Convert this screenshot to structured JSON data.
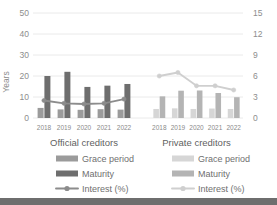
{
  "chart_data": {
    "type": "bar",
    "title": "",
    "categories": [
      "2018",
      "2019",
      "2020",
      "2021",
      "2022"
    ],
    "ylabel": "Years",
    "ylabel_right": "",
    "ylim": [
      0,
      50
    ],
    "ylim_right": [
      0,
      15
    ],
    "yticks": [
      "0",
      "10",
      "20",
      "30",
      "40",
      "50"
    ],
    "yticks_right": [
      "0",
      "3",
      "6",
      "9",
      "12",
      "15"
    ],
    "grid": true,
    "legend_position": "bottom",
    "panels": [
      {
        "name": "official",
        "title": "Official creditors",
        "series": [
          {
            "name": "Grace period",
            "type": "bar",
            "axis": "left",
            "color": "#9b9b9b",
            "values": [
              4.8,
              4.1,
              3.9,
              4.2,
              4.0
            ]
          },
          {
            "name": "Maturity",
            "type": "bar",
            "axis": "left",
            "color": "#6e6e6e",
            "values": [
              20.0,
              22.0,
              14.8,
              15.4,
              16.2
            ]
          },
          {
            "name": "Interest (%)",
            "type": "line",
            "axis": "right",
            "color": "#8c8c8c",
            "values": [
              2.5,
              2.1,
              2.0,
              2.1,
              2.7
            ]
          }
        ]
      },
      {
        "name": "private",
        "title": "Private creditors",
        "series": [
          {
            "name": "Grace period",
            "type": "bar",
            "axis": "left",
            "color": "#d6d6d6",
            "values": [
              4.3,
              4.6,
              4.3,
              4.5,
              4.3
            ]
          },
          {
            "name": "Maturity",
            "type": "bar",
            "axis": "left",
            "color": "#b4b4b4",
            "values": [
              10.3,
              13.0,
              13.1,
              11.9,
              9.9
            ]
          },
          {
            "name": "Interest (%)",
            "type": "line",
            "axis": "right",
            "color": "#cfcfcf",
            "values": [
              6.0,
              6.5,
              4.6,
              4.6,
              4.0
            ]
          }
        ]
      }
    ]
  },
  "axes": {
    "left_label": "Years",
    "left_ticks": [
      "50",
      "40",
      "30",
      "20",
      "10",
      "0"
    ],
    "right_ticks": [
      "15",
      "12",
      "9",
      "6",
      "3",
      "0"
    ]
  },
  "panels": {
    "official": {
      "title": "Official creditors",
      "categories": [
        "2018",
        "2019",
        "2020",
        "2021",
        "2022"
      ],
      "legend": [
        "Grace period",
        "Maturity",
        "Interest (%)"
      ]
    },
    "private": {
      "title": "Private creditors",
      "categories": [
        "2018",
        "2019",
        "2020",
        "2021",
        "2022"
      ],
      "legend": [
        "Grace period",
        "Maturity",
        "Interest (%)"
      ]
    }
  },
  "colors": {
    "grace_official": "#9b9b9b",
    "maturity_official": "#6e6e6e",
    "interest_official": "#8c8c8c",
    "grace_private": "#d6d6d6",
    "maturity_private": "#b4b4b4",
    "interest_private": "#cfcfcf",
    "grid": "#e8e8e8",
    "text": "#8d8d8d",
    "footer_bar": "#6e6e6e"
  }
}
